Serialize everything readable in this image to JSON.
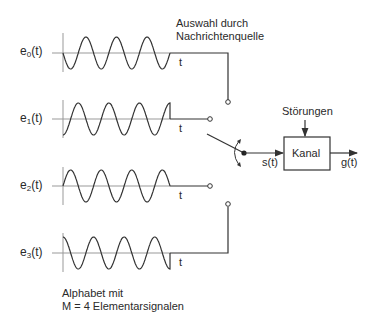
{
  "signals": [
    {
      "name": "e",
      "index": "0",
      "suffix": "(t)",
      "time_label": "t",
      "phase": "sin-neg-start"
    },
    {
      "name": "e",
      "index": "1",
      "suffix": "(t)",
      "time_label": "t",
      "phase": "neg-cos"
    },
    {
      "name": "e",
      "index": "2",
      "suffix": "(t)",
      "time_label": "t",
      "phase": "sin"
    },
    {
      "name": "e",
      "index": "3",
      "suffix": "(t)",
      "time_label": "t",
      "phase": "cos"
    }
  ],
  "source_selection": {
    "line1": "Auswahl durch",
    "line2": "Nachrichtenquelle"
  },
  "switch": {
    "output_label": "s(t)"
  },
  "channel": {
    "label": "Kanal",
    "disturbance_label": "Störungen",
    "output_label": "g(t)"
  },
  "alphabet": {
    "line1": "Alphabet mit",
    "line2": "M = 4 Elementarsignalen"
  },
  "colors": {
    "stroke": "#333333",
    "axis": "#888888"
  }
}
